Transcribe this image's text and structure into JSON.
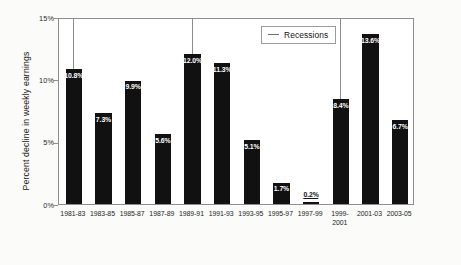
{
  "chart_data": {
    "type": "bar",
    "title": "",
    "xlabel": "",
    "ylabel": "Percent decline in weekly earnings",
    "ylim": [
      0,
      15
    ],
    "grid": false,
    "legend_position": "upper-center-right",
    "categories": [
      "1981-83",
      "1983-85",
      "1985-87",
      "1987-89",
      "1989-91",
      "1991-93",
      "1993-95",
      "1995-97",
      "1997-99",
      "1999-2001",
      "2001-03",
      "2003-05"
    ],
    "values": [
      10.8,
      7.3,
      9.9,
      5.6,
      12.0,
      11.3,
      5.1,
      1.7,
      0.2,
      8.4,
      13.6,
      6.7
    ],
    "value_labels": [
      "10.8%",
      "7.3%",
      "9.9%",
      "5.6%",
      "12.0%",
      "11.3%",
      "5.1%",
      "1.7%",
      "0.2%",
      "8.4%",
      "13.6%",
      "6.7%"
    ],
    "ytick_labels": [
      "0%",
      "5%",
      "10%",
      "15%"
    ],
    "ytick_values": [
      0,
      5,
      10,
      15
    ],
    "legend": [
      {
        "label": "Recessions",
        "marker": "line"
      }
    ],
    "annotations": {
      "recession_lines_at_categories": [
        "1981-83",
        "1989-91",
        "1999-2001"
      ]
    },
    "colors": {
      "bar": "#111111",
      "bar_label": "#ffffff",
      "recession_line": "#8b8b8b",
      "frame": "#8e8e8e",
      "plot_background": "#ffffff",
      "page_background": "#fbfbfa"
    }
  }
}
